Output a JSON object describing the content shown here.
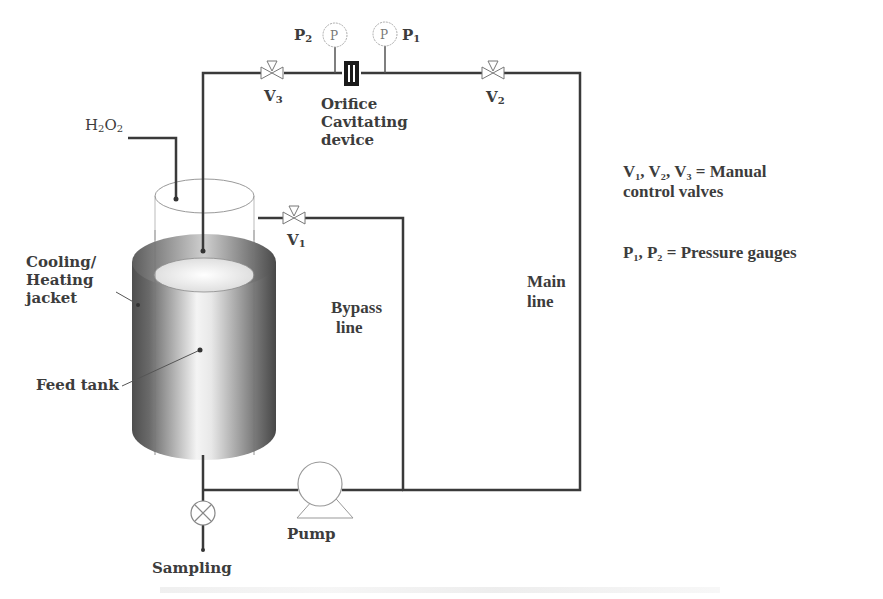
{
  "diagram": {
    "type": "process-flow-schematic",
    "labels": {
      "p2": "P",
      "p2_sub": "2",
      "p1": "P",
      "p1_sub": "1",
      "gauge_text": "P",
      "v3": "V",
      "v3_sub": "3",
      "v2": "V",
      "v2_sub": "2",
      "v1": "V",
      "v1_sub": "1",
      "orifice_line1": "Orifice",
      "orifice_line2": "Cavitating",
      "orifice_line3": "device",
      "h2o2_h": "H",
      "h2o2_2a": "2",
      "h2o2_o": "O",
      "h2o2_2b": "2",
      "jacket_line1": "Cooling/",
      "jacket_line2": "Heating",
      "jacket_line3": "jacket",
      "feed_tank": "Feed tank",
      "bypass_line1": "Bypass",
      "bypass_line2": "line",
      "main_line1": "Main",
      "main_line2": "line",
      "pump": "Pump",
      "sampling": "Sampling"
    },
    "legend": {
      "valves_line1": "V₁, V₂, V₃ = Manual",
      "valves_line2": "control   valves",
      "gauges": "P₁, P₂ = Pressure gauges"
    },
    "colors": {
      "pipe": "#3a3a3a",
      "outline": "#9a9a9a",
      "jacket_dark": "#5a5a5a",
      "jacket_light": "#f2f2f2",
      "orifice": "#1a1a1a"
    }
  }
}
